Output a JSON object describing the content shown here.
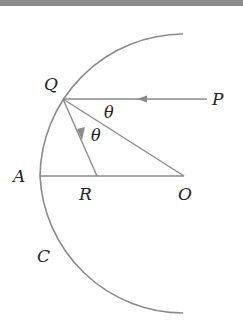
{
  "diagram": {
    "type": "concave spherical mirror ray diagram",
    "colors": {
      "line": "#8a8a8a",
      "text": "#222222",
      "band": "#8c8c8c"
    },
    "labels": {
      "Q": "Q",
      "P": "P",
      "A": "A",
      "R": "R",
      "O": "O",
      "C": "C",
      "theta1": "θ",
      "theta2": "θ"
    },
    "elements": {
      "mirror_arc": "circular arc centered at O passing through Q, A, C",
      "incident_ray": "P → Q (horizontal, arrow pointing left)",
      "reflected_ray": "Q → R (arrow pointing down toward R)",
      "normal": "Q — O (radius)",
      "axis": "A — O (principal axis through R)"
    }
  }
}
